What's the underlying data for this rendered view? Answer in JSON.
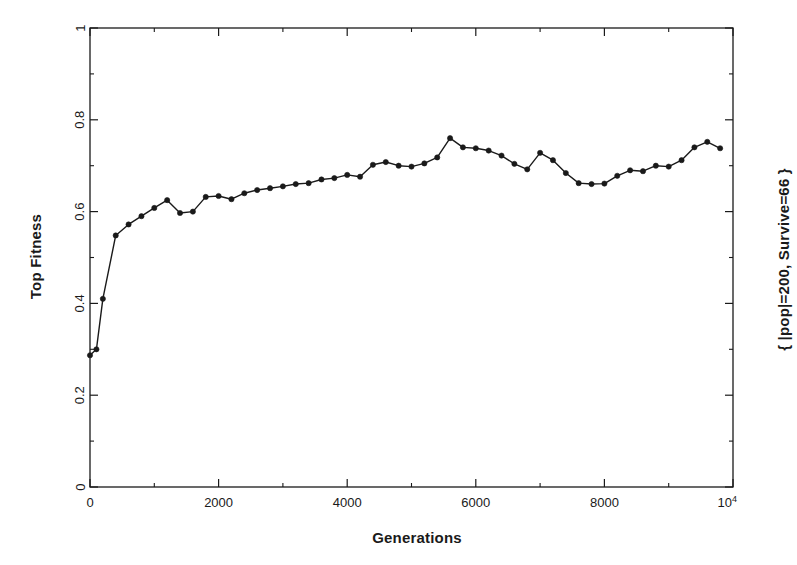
{
  "figure": {
    "background_color": "#ffffff",
    "ink_color": "#1a1a1a"
  },
  "labels": {
    "ylabel": "Top Fitness",
    "xlabel": "Generations",
    "right_annotation": "{ |pop|=200, Survive=66 }"
  },
  "axes": {
    "y_ticks": [
      "0",
      "0.2",
      "0.4",
      "0.6",
      "0.8",
      "1"
    ],
    "y_tick_values": [
      0,
      0.2,
      0.4,
      0.6,
      0.8,
      1
    ],
    "x_ticks": [
      "0",
      "2000",
      "4000",
      "6000",
      "8000",
      "10"
    ],
    "x_tick_values": [
      0,
      2000,
      4000,
      6000,
      8000,
      10000
    ],
    "x_last_tick_base": "10",
    "x_last_tick_exponent": "4"
  },
  "chart_data": {
    "type": "line",
    "title": "",
    "xlabel": "Generations",
    "ylabel": "Top Fitness",
    "annotation": "{ |pop|=200, Survive=66 }",
    "xlim": [
      0,
      10000
    ],
    "ylim": [
      0,
      1
    ],
    "grid": false,
    "legend": false,
    "marker": "filled-circle",
    "line_color": "#1a1a1a",
    "marker_color": "#1a1a1a",
    "x": [
      0,
      100,
      200,
      400,
      600,
      800,
      1000,
      1200,
      1400,
      1600,
      1800,
      2000,
      2200,
      2400,
      2600,
      2800,
      3000,
      3200,
      3400,
      3600,
      3800,
      4000,
      4200,
      4400,
      4600,
      4800,
      5000,
      5200,
      5400,
      5600,
      5800,
      6000,
      6200,
      6400,
      6600,
      6800,
      7000,
      7200,
      7400,
      7600,
      7800,
      8000,
      8200,
      8400,
      8600,
      8800,
      9000,
      9200,
      9400,
      9600,
      9800
    ],
    "y": [
      0.287,
      0.3,
      0.41,
      0.548,
      0.572,
      0.59,
      0.608,
      0.625,
      0.597,
      0.6,
      0.632,
      0.634,
      0.627,
      0.64,
      0.647,
      0.651,
      0.655,
      0.66,
      0.662,
      0.67,
      0.673,
      0.68,
      0.676,
      0.702,
      0.708,
      0.7,
      0.698,
      0.705,
      0.718,
      0.76,
      0.74,
      0.738,
      0.733,
      0.722,
      0.704,
      0.692,
      0.728,
      0.712,
      0.684,
      0.662,
      0.66,
      0.661,
      0.678,
      0.69,
      0.688,
      0.7,
      0.698,
      0.712,
      0.74,
      0.752,
      0.738
    ],
    "series": [
      {
        "name": "Top Fitness",
        "values": [
          0.287,
          0.3,
          0.41,
          0.548,
          0.572,
          0.59,
          0.608,
          0.625,
          0.597,
          0.6,
          0.632,
          0.634,
          0.627,
          0.64,
          0.647,
          0.651,
          0.655,
          0.66,
          0.662,
          0.67,
          0.673,
          0.68,
          0.676,
          0.702,
          0.708,
          0.7,
          0.698,
          0.705,
          0.718,
          0.76,
          0.74,
          0.738,
          0.733,
          0.722,
          0.704,
          0.692,
          0.728,
          0.712,
          0.684,
          0.662,
          0.66,
          0.661,
          0.678,
          0.69,
          0.688,
          0.7,
          0.698,
          0.712,
          0.74,
          0.752,
          0.738
        ]
      }
    ]
  },
  "plot_geometry": {
    "left": 90,
    "right": 733,
    "top": 28,
    "bottom": 487
  }
}
